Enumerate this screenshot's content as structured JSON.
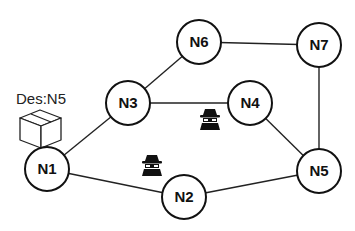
{
  "diagram": {
    "nodes": [
      {
        "id": "N1",
        "label": "N1",
        "x": 47,
        "y": 169
      },
      {
        "id": "N2",
        "label": "N2",
        "x": 184,
        "y": 197
      },
      {
        "id": "N3",
        "label": "N3",
        "x": 128,
        "y": 103
      },
      {
        "id": "N4",
        "label": "N4",
        "x": 250,
        "y": 103
      },
      {
        "id": "N5",
        "label": "N5",
        "x": 319,
        "y": 171
      },
      {
        "id": "N6",
        "label": "N6",
        "x": 199,
        "y": 42
      },
      {
        "id": "N7",
        "label": "N7",
        "x": 319,
        "y": 45
      }
    ],
    "edges": [
      [
        "N1",
        "N3"
      ],
      [
        "N1",
        "N2"
      ],
      [
        "N3",
        "N6"
      ],
      [
        "N3",
        "N4"
      ],
      [
        "N6",
        "N7"
      ],
      [
        "N7",
        "N5"
      ],
      [
        "N4",
        "N5"
      ],
      [
        "N2",
        "N5"
      ]
    ],
    "packet": {
      "label": "Des:N5",
      "icon": "package-box-icon",
      "at": "N1"
    },
    "attackers": [
      {
        "icon": "spy-icon",
        "x": 210,
        "y": 121
      },
      {
        "icon": "spy-icon",
        "x": 152,
        "y": 167
      }
    ]
  }
}
